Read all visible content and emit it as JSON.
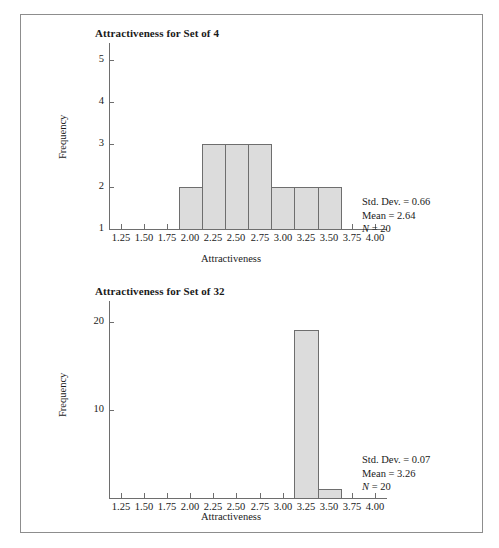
{
  "figure": {
    "border_color": "#8d8d8d",
    "bar_fill": "#dcdcdc",
    "bar_stroke": "#6e6e6e",
    "axis_color": "#6e6e6e"
  },
  "chart_data": [
    {
      "type": "bar",
      "id": "set-of-4",
      "title": "Attractiveness for Set of 4",
      "xlabel": "Attractiveness",
      "ylabel": "Frequency",
      "xlim": [
        1.125,
        4.125
      ],
      "ylim": [
        1,
        5.35
      ],
      "xticks": [
        1.25,
        1.5,
        1.75,
        2.0,
        2.25,
        2.5,
        2.75,
        3.0,
        3.25,
        3.5,
        3.75,
        4.0
      ],
      "xtick_labels": [
        "1.25",
        "1.50",
        "1.75",
        "2.00",
        "2.25",
        "2.50",
        "2.75",
        "3.00",
        "3.25",
        "3.50",
        "3.75",
        "4.00"
      ],
      "yticks": [
        1,
        2,
        3,
        4,
        5
      ],
      "ytick_labels": [
        "1",
        "2",
        "3",
        "4",
        "5"
      ],
      "grid": false,
      "bin_width": 0.25,
      "bins": [
        {
          "left": 1.875,
          "right": 2.125,
          "value": 2
        },
        {
          "left": 2.125,
          "right": 2.375,
          "value": 3
        },
        {
          "left": 2.375,
          "right": 2.625,
          "value": 3
        },
        {
          "left": 2.625,
          "right": 2.875,
          "value": 3
        },
        {
          "left": 2.875,
          "right": 3.125,
          "value": 2
        },
        {
          "left": 3.125,
          "right": 3.375,
          "value": 2
        },
        {
          "left": 3.375,
          "right": 3.625,
          "value": 2
        }
      ],
      "annotations": {
        "std_dev": "Std. Dev. = 0.66",
        "mean": "Mean = 2.64",
        "n_symbol": "N",
        "n_value": " = 20"
      }
    },
    {
      "type": "bar",
      "id": "set-of-32",
      "title": "Attractiveness for Set of 32",
      "xlabel": "Attractiveness",
      "ylabel": "Frequency",
      "xlim": [
        1.125,
        4.125
      ],
      "ylim": [
        0,
        22
      ],
      "xticks": [
        1.25,
        1.5,
        1.75,
        2.0,
        2.25,
        2.5,
        2.75,
        3.0,
        3.25,
        3.5,
        3.75,
        4.0
      ],
      "xtick_labels": [
        "1.25",
        "1.50",
        "1.75",
        "2.00",
        "2.25",
        "2.50",
        "2.75",
        "3.00",
        "3.25",
        "3.50",
        "3.75",
        "4.00"
      ],
      "yticks": [
        10,
        20
      ],
      "ytick_labels": [
        "10",
        "20"
      ],
      "grid": false,
      "bin_width": 0.25,
      "bins": [
        {
          "left": 3.125,
          "right": 3.375,
          "value": 19
        },
        {
          "left": 3.375,
          "right": 3.625,
          "value": 1
        }
      ],
      "annotations": {
        "std_dev": "Std. Dev. = 0.07",
        "mean": "Mean = 3.26",
        "n_symbol": "N",
        "n_value": " = 20"
      }
    }
  ]
}
